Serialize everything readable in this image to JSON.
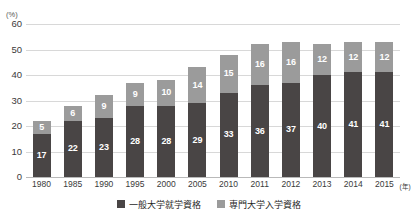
{
  "chart_data": {
    "type": "bar",
    "subtype": "stacked-column",
    "title": "",
    "xlabel": "年",
    "ylabel": "(%)",
    "unit": "(%)",
    "year_suffix": "(年)",
    "categories": [
      "1980",
      "1985",
      "1990",
      "1995",
      "2000",
      "2005",
      "2010",
      "2011",
      "2012",
      "2013",
      "2014",
      "2015"
    ],
    "series": [
      {
        "name": "一般大学就学資格",
        "color": "#494545",
        "values": [
          17,
          22,
          23,
          28,
          28,
          29,
          33,
          36,
          37,
          40,
          41,
          41
        ]
      },
      {
        "name": "専門大学入学資格",
        "color": "#9b9b9b",
        "values": [
          5,
          6,
          9,
          9,
          10,
          14,
          15,
          16,
          16,
          12,
          12,
          12
        ]
      }
    ],
    "totals": [
      22,
      28,
      32,
      37,
      38,
      43,
      48,
      52,
      53,
      52,
      53,
      53
    ],
    "ylim": [
      0,
      60
    ],
    "yticks": [
      0,
      10,
      20,
      30,
      40,
      50,
      60
    ],
    "grid": true,
    "legend_position": "bottom-center"
  },
  "axes": {
    "y_unit": "(%)",
    "y_tick_labels": [
      "60",
      "50",
      "40",
      "30",
      "20",
      "10",
      "0"
    ],
    "x_tick_labels": [
      "1980",
      "1985",
      "1990",
      "1995",
      "2000",
      "2005",
      "2010",
      "2011",
      "2012",
      "2013",
      "2014",
      "2015"
    ],
    "x_axis_unit": "(年)"
  },
  "legend": {
    "items": [
      {
        "label": "一般大学就学資格",
        "color": "#494545"
      },
      {
        "label": "専門大学入学資格",
        "color": "#9b9b9b"
      }
    ]
  },
  "page_bleed": {
    "text": ""
  }
}
